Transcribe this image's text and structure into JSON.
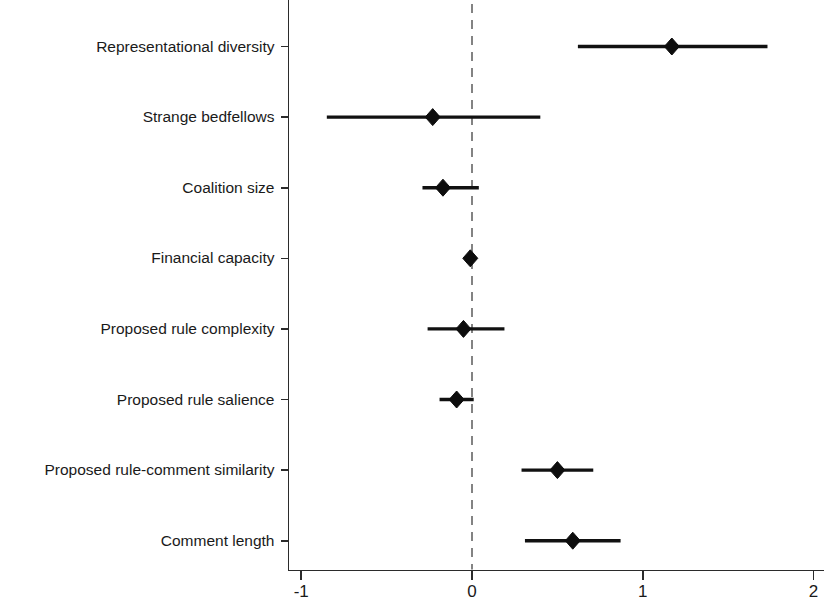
{
  "figure": {
    "title": "",
    "width": 824,
    "height": 604,
    "background": "#ffffff",
    "marker_color": "#0d0d0d",
    "line_color": "#111111",
    "axis_color": "#2b2b2b",
    "zero_line_color": "#6e6e6e"
  },
  "axis": {
    "x_ticks": [
      "-1",
      "0",
      "1",
      "2"
    ],
    "x_tick_values": [
      -1,
      0,
      1,
      2
    ],
    "xlim": [
      -1.12,
      2.0
    ],
    "xlabel": "",
    "ylabel": "",
    "zero_reference": 0
  },
  "chart_data": {
    "type": "scatter",
    "title": "",
    "subtitle": "",
    "xlabel": "",
    "ylabel": "",
    "xlim": [
      -1.12,
      2.0
    ],
    "grid": false,
    "legend": "none",
    "orientation": "horizontal",
    "plot_style": "coefficient-plot",
    "reference_line": 0,
    "reference_line_style": "dashed",
    "categories": [
      "Representational diversity",
      "Strange bedfellows",
      "Coalition size",
      "Financial capacity",
      "Proposed rule complexity",
      "Proposed rule salience",
      "Proposed rule-comment similarity",
      "Comment length"
    ],
    "values": [
      1.17,
      -0.23,
      -0.17,
      -0.01,
      -0.05,
      -0.09,
      0.5,
      0.59
    ],
    "ci_low": [
      0.62,
      -0.85,
      -0.29,
      -0.02,
      -0.26,
      -0.19,
      0.29,
      0.31
    ],
    "ci_high": [
      1.73,
      0.4,
      0.04,
      0.01,
      0.19,
      0.01,
      0.71,
      0.87
    ],
    "points": [
      {
        "label": "Representational diversity",
        "estimate": 1.17,
        "ci_low": 0.62,
        "ci_high": 1.73
      },
      {
        "label": "Strange bedfellows",
        "estimate": -0.23,
        "ci_low": -0.85,
        "ci_high": 0.4
      },
      {
        "label": "Coalition size",
        "estimate": -0.17,
        "ci_low": -0.29,
        "ci_high": 0.04
      },
      {
        "label": "Financial capacity",
        "estimate": -0.01,
        "ci_low": -0.02,
        "ci_high": 0.01
      },
      {
        "label": "Proposed rule complexity",
        "estimate": -0.05,
        "ci_low": -0.26,
        "ci_high": 0.19
      },
      {
        "label": "Proposed rule salience",
        "estimate": -0.09,
        "ci_low": -0.19,
        "ci_high": 0.01
      },
      {
        "label": "Proposed rule-comment similarity",
        "estimate": 0.5,
        "ci_low": 0.29,
        "ci_high": 0.71
      },
      {
        "label": "Comment length",
        "estimate": 0.59,
        "ci_low": 0.31,
        "ci_high": 0.87
      }
    ]
  }
}
